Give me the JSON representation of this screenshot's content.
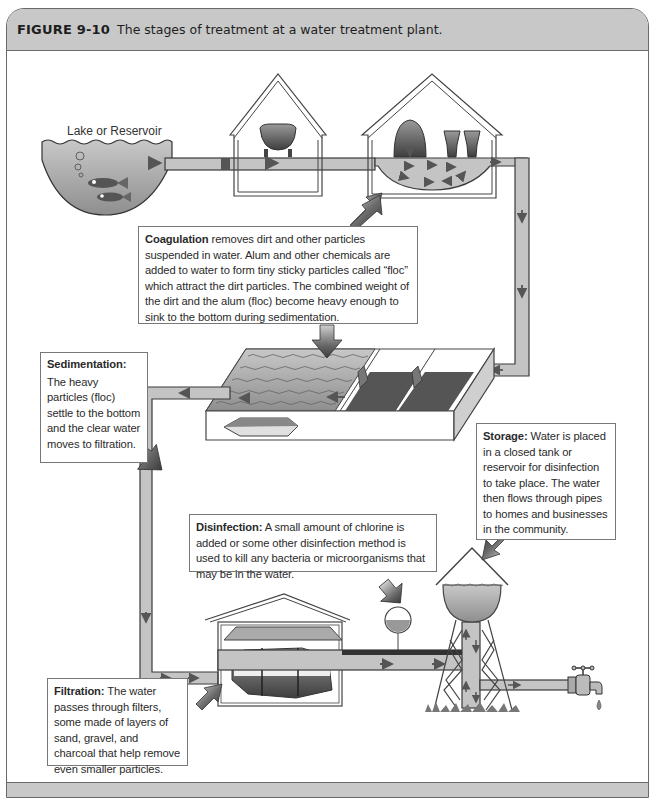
{
  "figure": {
    "number": "FIGURE 9-10",
    "caption": "The stages of treatment at a water treatment plant."
  },
  "labels": {
    "lake": "Lake or Reservoir"
  },
  "stages": {
    "coagulation": {
      "term": "Coagulation",
      "text": " removes dirt and other particles suspended in water. Alum and other chemicals are added to water to form tiny sticky particles called “floc” which attract the dirt particles. The combined weight of the dirt and the alum (floc) become heavy enough to sink to the bottom during sedimentation."
    },
    "sedimentation": {
      "term": "Sedimentation:",
      "text": "The heavy particles (floc) settle to the bottom and the clear water moves to filtration."
    },
    "storage": {
      "term": "Storage:",
      "text": " Water is placed in a closed tank or reservoir for disinfection to take place. The water then flows through pipes to homes and businesses in the community."
    },
    "disinfection": {
      "term": "Disinfection:",
      "text": " A small amount of chlorine is added or some other disinfection method is used to kill any bacteria or microorganisms that may be in the water."
    },
    "filtration": {
      "term": "Filtration:",
      "text": " The water passes through filters, some made of layers of sand, gravel, and charcoal that help remove even smaller particles."
    }
  },
  "colors": {
    "header_bg": "#c8c8c8",
    "pipe_fill": "#c4c4c4",
    "pipe_stroke": "#3a3a3a",
    "water_fill": "#b5b5b5",
    "callout_arrow": "#555555"
  }
}
